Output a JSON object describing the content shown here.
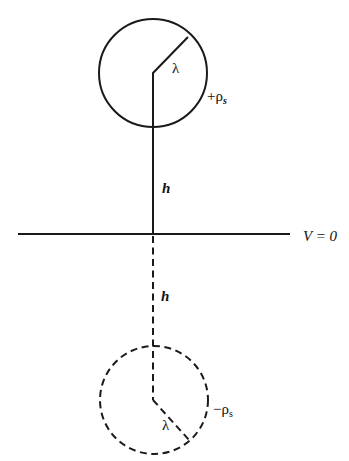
{
  "diagram": {
    "labels": {
      "upper_radius": "λ",
      "upper_charge": "+ρ",
      "upper_charge_sub": "s",
      "upper_height": "h",
      "plane_potential": "V = 0",
      "lower_height": "h",
      "lower_radius": "λ",
      "lower_charge": "−ρ",
      "lower_charge_sub": "s"
    },
    "elements": {
      "real_conductor": "solid circle",
      "image_conductor": "dashed circle",
      "ground_plane": "horizontal line"
    },
    "colors": {
      "ink": "#1a1a1a",
      "background": "#ffffff"
    }
  }
}
